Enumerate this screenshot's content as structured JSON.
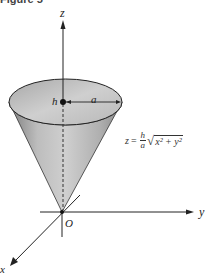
{
  "figure": {
    "caption": "Figure 5",
    "axes": {
      "z_label": "z",
      "y_label": "y",
      "x_label": "x",
      "origin_label": "O"
    },
    "cone": {
      "height_label": "h",
      "radius_label": "a",
      "equation": {
        "lhs": "z",
        "equals": "=",
        "frac_num": "h",
        "frac_den": "a",
        "radical": "√",
        "radicand": "x² + y²"
      }
    },
    "colors": {
      "cone_light": "#d9d9d9",
      "cone_mid": "#b5b5b5",
      "cone_dark": "#8c8c8c",
      "top_ellipse": "#c8c8c8",
      "axis": "#222222"
    }
  }
}
